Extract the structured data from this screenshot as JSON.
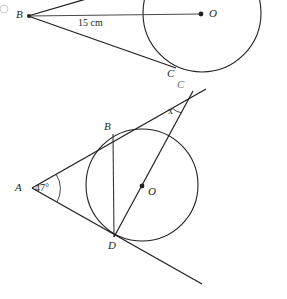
{
  "page": {
    "width": 287,
    "height": 299,
    "background": "#ffffff",
    "stroke_color": "#231f20",
    "faint_stroke_color": "#6f6c6d"
  },
  "figures": [
    {
      "id": "figure-top",
      "description": "Circle with centre O and two tangent/secant lines drawn from external point B, tangent point C, distance BO labelled 15 cm",
      "labels": {
        "vertex_b": "B",
        "centre_o": "O",
        "tangent_point_c": "C",
        "measure_bo": "15 cm"
      },
      "circle": {
        "cx": 202,
        "cy": 13,
        "r": 59
      },
      "points": {
        "B": {
          "x": 28,
          "y": 16
        },
        "O": {
          "x": 202,
          "y": 14
        },
        "C": {
          "x": 171,
          "y": 66
        }
      },
      "segments": [
        {
          "name": "line-b-to-top-edge",
          "from": {
            "x": 28,
            "y": 16
          },
          "to": {
            "x": 92,
            "y": -2
          }
        },
        {
          "name": "line-b-to-o",
          "from": {
            "x": 28,
            "y": 16
          },
          "to": {
            "x": 202,
            "y": 14
          }
        },
        {
          "name": "line-b-to-c",
          "from": {
            "x": 28,
            "y": 16
          },
          "to": {
            "x": 175,
            "y": 68
          }
        }
      ]
    },
    {
      "id": "figure-bottom",
      "description": "Circle with centre O inscribed in angle A of 47 degrees; tangents from A touch at B and D; line from D through O meets the tangent line at C where angle x is marked",
      "labels": {
        "vertex_a": "A",
        "angle_a": "47°",
        "tangent_point_b": "B",
        "tangent_point_d": "D",
        "centre_o": "O",
        "vertex_c": "C",
        "angle_x": "x"
      },
      "circle": {
        "cx": 142,
        "cy": 185,
        "r": 56
      },
      "points": {
        "A": {
          "x": 32,
          "y": 188
        },
        "B": {
          "x": 113,
          "y": 134
        },
        "D": {
          "x": 114,
          "y": 236
        },
        "O": {
          "x": 142,
          "y": 186
        },
        "C": {
          "x": 189,
          "y": 96
        }
      },
      "segments": [
        {
          "name": "tangent-a-b-to-c",
          "from": {
            "x": 32,
            "y": 188
          },
          "to": {
            "x": 205,
            "y": 89
          }
        },
        {
          "name": "tangent-a-d-extended",
          "from": {
            "x": 32,
            "y": 188
          },
          "to": {
            "x": 201,
            "y": 283
          }
        },
        {
          "name": "chord-b-d",
          "from": {
            "x": 113,
            "y": 134
          },
          "to": {
            "x": 114,
            "y": 236
          }
        },
        {
          "name": "secant-d-o-c",
          "from": {
            "x": 114,
            "y": 236
          },
          "to": {
            "x": 192,
            "y": 92
          }
        }
      ],
      "arcs": [
        {
          "name": "angle-arc-a",
          "cx": 32,
          "cy": 188,
          "r": 26
        },
        {
          "name": "angle-arc-c",
          "cx": 189,
          "cy": 96,
          "r": 19
        }
      ]
    }
  ]
}
